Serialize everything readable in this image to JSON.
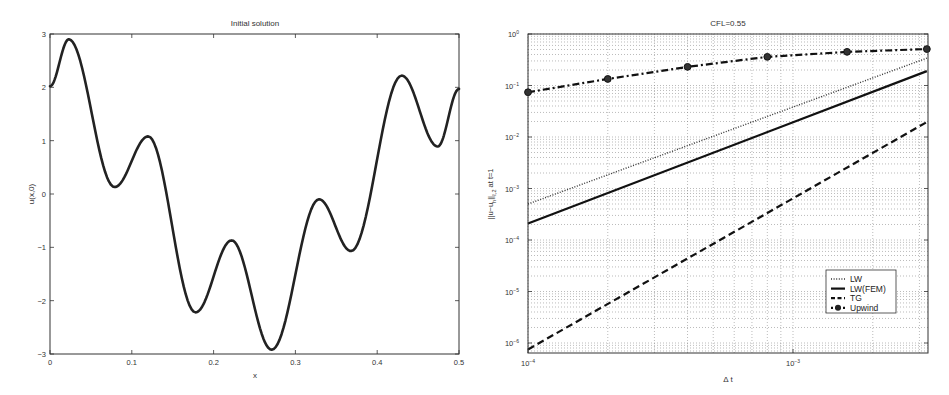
{
  "chart_data": [
    {
      "type": "line",
      "title": "Initial solution",
      "xlabel": "x",
      "ylabel": "u(x,0)",
      "xlim": [
        0,
        0.5
      ],
      "ylim": [
        -3,
        3
      ],
      "xticks": [
        0,
        0.1,
        0.2,
        0.3,
        0.4,
        0.5
      ],
      "xtick_labels": [
        "0",
        "0.1",
        "0.2",
        "0.3",
        "0.4",
        "0.5"
      ],
      "yticks": [
        -3,
        -2,
        -1,
        0,
        1,
        2,
        3
      ],
      "ytick_labels": [
        "−3",
        "−2",
        "−1",
        "0",
        "1",
        "2",
        "3"
      ],
      "grid": false,
      "series": [
        {
          "name": "u(x,0)",
          "style": "solid-thick",
          "extrema_points": {
            "x": [
              0,
              0.023,
              0.079,
              0.12,
              0.178,
              0.222,
              0.271,
              0.329,
              0.368,
              0.43,
              0.474,
              0.5
            ],
            "y": [
              2.02,
              2.9,
              0.13,
              1.08,
              -2.22,
              -0.87,
              -2.92,
              -0.1,
              -1.07,
              2.22,
              0.89,
              1.97
            ]
          }
        }
      ]
    },
    {
      "type": "line",
      "title": "CFL=0.55",
      "xlabel": "Δ t",
      "ylabel": "||u−u_h||_{ℓ,2} at t=1",
      "xscale": "log",
      "yscale": "log",
      "xlim": [
        0.0001,
        0.0032
      ],
      "ylim": [
        6e-07,
        1
      ],
      "xticks": [
        0.0001,
        0.001
      ],
      "xtick_labels": [
        "10",
        "10"
      ],
      "xtick_exponents": [
        "−4",
        "−3"
      ],
      "yticks": [
        1e-06,
        1e-05,
        0.0001,
        0.001,
        0.01,
        0.1,
        1
      ],
      "ytick_labels": [
        "10",
        "10",
        "10",
        "10",
        "10",
        "10",
        "10"
      ],
      "ytick_exponents": [
        "−6",
        "−5",
        "−4",
        "−3",
        "−2",
        "−1",
        "0"
      ],
      "grid": true,
      "legend_position": "lower right",
      "legend": [
        "LW",
        "LW(FEM)",
        "TG",
        "Upwind"
      ],
      "series": [
        {
          "name": "LW",
          "style": "dotted",
          "x": [
            0.0001,
            0.0032
          ],
          "y": [
            0.0005,
            0.34
          ]
        },
        {
          "name": "LW(FEM)",
          "style": "solid",
          "x": [
            0.0001,
            0.0032
          ],
          "y": [
            0.00021,
            0.19
          ]
        },
        {
          "name": "TG",
          "style": "dashed",
          "x": [
            0.0001,
            0.0032
          ],
          "y": [
            7.5e-07,
            0.0195
          ]
        },
        {
          "name": "Upwind",
          "style": "dash-dot-marker",
          "x": [
            0.0001,
            0.0002,
            0.0004,
            0.0008,
            0.0016,
            0.0032
          ],
          "y": [
            0.074,
            0.134,
            0.23,
            0.36,
            0.45,
            0.51
          ]
        }
      ]
    }
  ]
}
